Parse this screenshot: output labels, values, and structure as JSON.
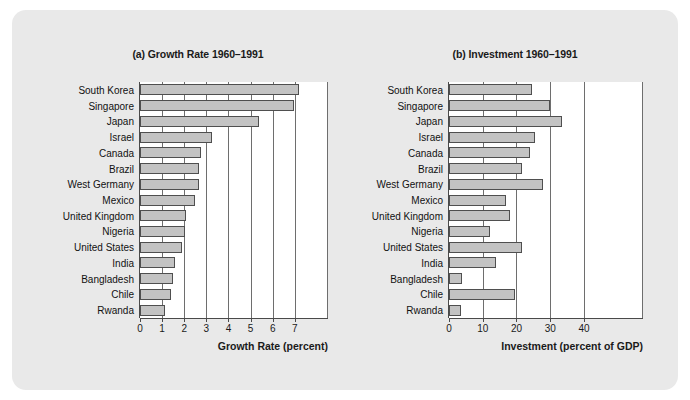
{
  "figure": {
    "background_color": "#e9e9e9",
    "bar_fill_color": "#c3c3c3",
    "bar_edge_color": "#4f4f4f"
  },
  "chart_data": [
    {
      "type": "bar",
      "orientation": "horizontal",
      "id": "growth",
      "title": "(a) Growth Rate 1960–1991",
      "xlabel": "Growth Rate (percent)",
      "ylabel": "",
      "xlim": [
        0,
        8.5
      ],
      "xticks": [
        0,
        1,
        2,
        3,
        4,
        5,
        6,
        7
      ],
      "xticklabels": [
        "0",
        "1",
        "2",
        "3",
        "4",
        "5",
        "6",
        "7"
      ],
      "grid": true,
      "legend": "none",
      "categories": [
        "South Korea",
        "Singapore",
        "Japan",
        "Israel",
        "Canada",
        "Brazil",
        "West Germany",
        "Mexico",
        "United Kingdom",
        "Nigeria",
        "United States",
        "India",
        "Bangladesh",
        "Chile",
        "Rwanda"
      ],
      "values": [
        7.2,
        6.95,
        5.4,
        3.25,
        2.75,
        2.65,
        2.65,
        2.5,
        2.1,
        2.05,
        1.9,
        1.6,
        1.5,
        1.4,
        1.15
      ]
    },
    {
      "type": "bar",
      "orientation": "horizontal",
      "id": "investment",
      "title": "(b) Investment 1960–1991",
      "xlabel": "Investment (percent of GDP)",
      "ylabel": "",
      "xlim": [
        0,
        57.5
      ],
      "xticks": [
        0,
        10,
        20,
        30,
        40
      ],
      "xticklabels": [
        "0",
        "10",
        "20",
        "30",
        "40"
      ],
      "grid": true,
      "legend": "none",
      "categories": [
        "South Korea",
        "Singapore",
        "Japan",
        "Israel",
        "Canada",
        "Brazil",
        "West Germany",
        "Mexico",
        "United Kingdom",
        "Nigeria",
        "United States",
        "India",
        "Bangladesh",
        "Chile",
        "Rwanda"
      ],
      "values": [
        24.5,
        30.0,
        33.5,
        25.5,
        24.0,
        21.5,
        28.0,
        17.0,
        18.0,
        12.3,
        21.5,
        14.0,
        4.0,
        19.7,
        3.5
      ]
    }
  ]
}
